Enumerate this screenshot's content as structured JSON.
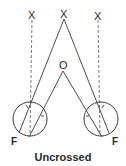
{
  "diagram": {
    "labels": {
      "left_target": "X",
      "center_target": "X",
      "right_target": "X",
      "fixation_point": "O",
      "left_fovea": "F",
      "right_fovea": "F"
    },
    "caption": "Uncrossed"
  }
}
